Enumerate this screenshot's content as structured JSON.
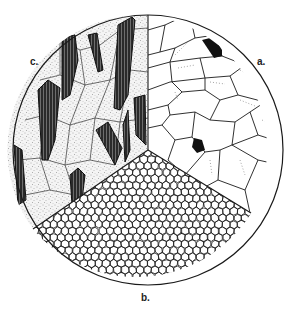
{
  "figure": {
    "type": "microstructure-diagram",
    "shape": "circle divided into three sectors",
    "sectors": [
      {
        "id": "a",
        "label": "a.",
        "position": "upper-right",
        "description": "coarse polygonal grains, mostly clear with faint dotted twin lines, two dark grains"
      },
      {
        "id": "b",
        "label": "b.",
        "position": "bottom",
        "description": "fine uniform equiaxed polygonal grains"
      },
      {
        "id": "c",
        "label": "c.",
        "position": "upper-left",
        "description": "stippled polygonal matrix with dark elongated lath-shaped crystals"
      }
    ],
    "colors": {
      "ink": "#1a1a1a",
      "background": "#ffffff",
      "stipple": "#555555",
      "dark_phase": "#111111"
    }
  }
}
